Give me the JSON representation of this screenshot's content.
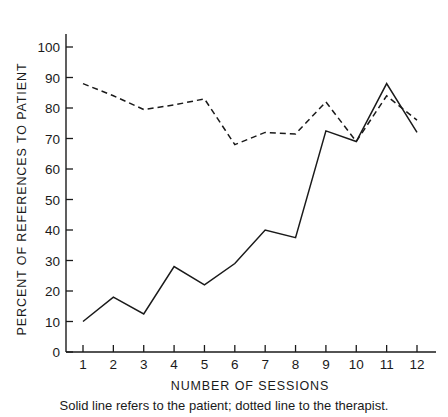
{
  "figure": {
    "caption": "Solid line refers to the patient; dotted line to the therapist."
  },
  "chart_data": {
    "type": "line",
    "title": "",
    "subtitle": "",
    "xlabel": "NUMBER OF SESSIONS",
    "ylabel": "PERCENT OF REFERENCES TO PATIENT",
    "x": [
      1,
      2,
      3,
      4,
      5,
      6,
      7,
      8,
      9,
      10,
      11,
      12
    ],
    "categories": [
      "1",
      "2",
      "3",
      "4",
      "5",
      "6",
      "7",
      "8",
      "9",
      "10",
      "11",
      "12"
    ],
    "xtick_labels": [
      "1",
      "2",
      "3",
      "4",
      "5",
      "6",
      "7",
      "8",
      "9",
      "10",
      "11",
      "12"
    ],
    "ytick_labels": [
      "0",
      "10",
      "20",
      "30",
      "40",
      "50",
      "60",
      "70",
      "80",
      "90",
      "100"
    ],
    "yticks": [
      0,
      10,
      20,
      30,
      40,
      50,
      60,
      70,
      80,
      90,
      100
    ],
    "xlim": [
      1,
      12
    ],
    "ylim": [
      0,
      105
    ],
    "grid": false,
    "legend_position": "none",
    "annotations": [
      "Solid line refers to the patient; dotted line to the therapist."
    ],
    "series": [
      {
        "name": "patient",
        "style": "solid",
        "color": "#1a1a1a",
        "values": [
          10,
          18,
          12.5,
          28,
          22,
          29,
          40,
          37.5,
          72.5,
          69,
          88,
          72
        ]
      },
      {
        "name": "therapist",
        "style": "dotted",
        "color": "#1a1a1a",
        "values": [
          88,
          84,
          79.5,
          81,
          83,
          68,
          72,
          71.5,
          82,
          69,
          84,
          76
        ]
      }
    ]
  },
  "colors": {
    "ink": "#1a1a1a",
    "background": "#ffffff"
  }
}
